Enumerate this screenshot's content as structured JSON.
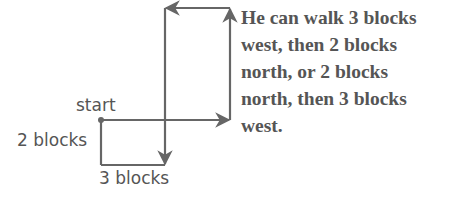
{
  "diagram": {
    "labels": {
      "start": "start",
      "vertical": "2 blocks",
      "horizontal": "3 blocks"
    },
    "caption_lines": [
      "He can walk 3 blocks",
      "west, then 2 blocks",
      "north, or 2 blocks",
      "north, then 3 blocks",
      "west."
    ],
    "colors": {
      "line": "#666666",
      "text": "#555555"
    }
  }
}
